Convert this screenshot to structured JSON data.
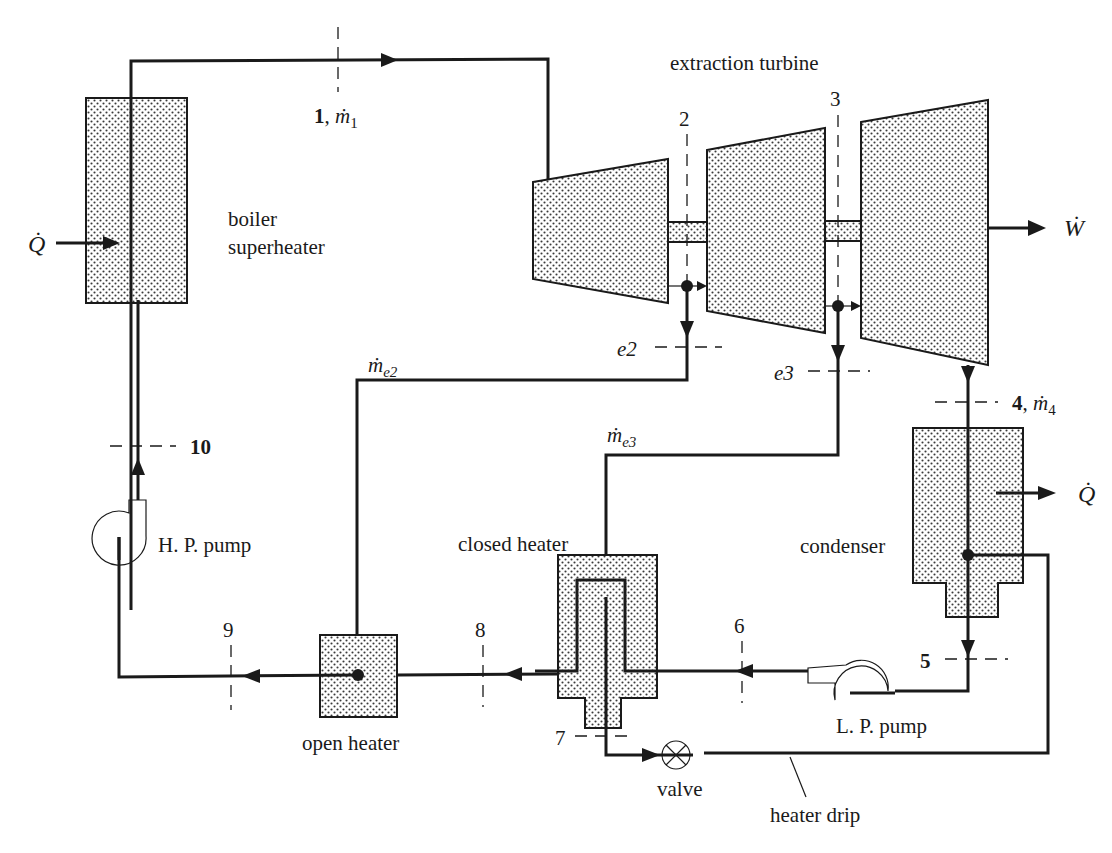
{
  "components": {
    "boiler": {
      "label_line1": "boiler",
      "label_line2": "superheater",
      "heat_in_symbol": "Q̇"
    },
    "turbine": {
      "label": "extraction turbine",
      "work_symbol": "Ẇ"
    },
    "condenser": {
      "label": "condenser",
      "heat_out_symbol": "Q̇"
    },
    "closed_heater": {
      "label": "closed heater"
    },
    "open_heater": {
      "label": "open heater"
    },
    "hp_pump": {
      "label": "H. P. pump"
    },
    "lp_pump": {
      "label": "L. P. pump"
    },
    "valve": {
      "label": "valve"
    },
    "heater_drip": {
      "label": "heater drip"
    }
  },
  "states": {
    "s1": {
      "num": "1",
      "sep": ", ",
      "flow": "ṁ",
      "sub": "1"
    },
    "s2": {
      "num": "2"
    },
    "s3": {
      "num": "3"
    },
    "s4": {
      "num": "4",
      "sep": ", ",
      "flow": "ṁ",
      "sub": "4"
    },
    "s5": {
      "num": "5"
    },
    "s6": {
      "num": "6"
    },
    "s7": {
      "num": "7"
    },
    "s8": {
      "num": "8"
    },
    "s9": {
      "num": "9"
    },
    "s10": {
      "num": "10"
    },
    "e2": {
      "num": "e2"
    },
    "e3": {
      "num": "e3"
    }
  },
  "flows": {
    "me2": {
      "flow": "ṁ",
      "sub": "e2"
    },
    "me3": {
      "flow": "ṁ",
      "sub": "e3"
    }
  },
  "colors": {
    "line": "#1a1a1a",
    "shading_dot": "#3a3a3a",
    "background": "#ffffff"
  }
}
